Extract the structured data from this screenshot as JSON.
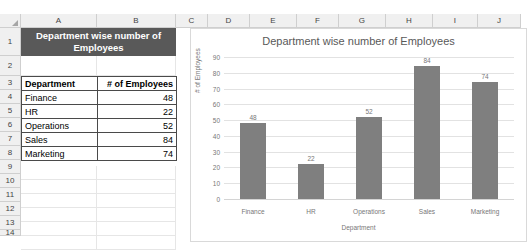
{
  "spreadsheet": {
    "column_headers": [
      "A",
      "B",
      "C",
      "D",
      "E",
      "F",
      "G",
      "H",
      "I",
      "J"
    ],
    "row_numbers": [
      "1",
      "2",
      "3",
      "4",
      "5",
      "6",
      "7",
      "8",
      "9",
      "10",
      "11",
      "12",
      "13",
      "14"
    ],
    "merged_title": "Department wise number of Employees",
    "table": {
      "headers": [
        "Department",
        "# of Employees"
      ],
      "rows": [
        [
          "Finance",
          "48"
        ],
        [
          "HR",
          "22"
        ],
        [
          "Operations",
          "52"
        ],
        [
          "Sales",
          "84"
        ],
        [
          "Marketing",
          "74"
        ]
      ]
    }
  },
  "chart_data": {
    "type": "bar",
    "title": "Department wise number of Employees",
    "categories": [
      "Finance",
      "HR",
      "Operations",
      "Sales",
      "Marketing"
    ],
    "values": [
      48,
      22,
      52,
      84,
      74
    ],
    "data_labels": [
      "48",
      "22",
      "52",
      "84",
      "74"
    ],
    "xlabel": "Department",
    "ylabel": "# of Employees",
    "ylim": [
      0,
      90
    ],
    "yticks": [
      "90",
      "80",
      "70",
      "60",
      "50",
      "40",
      "30",
      "20",
      "10",
      "0"
    ],
    "grid": true,
    "legend": "none",
    "bar_color": "#7f7f7f"
  },
  "colors": {
    "title_cell_bg": "#595959",
    "title_cell_text": "#ffffff",
    "bar": "#7f7f7f",
    "chart_text": "#777777",
    "header_strip": "#f0f0f0"
  }
}
